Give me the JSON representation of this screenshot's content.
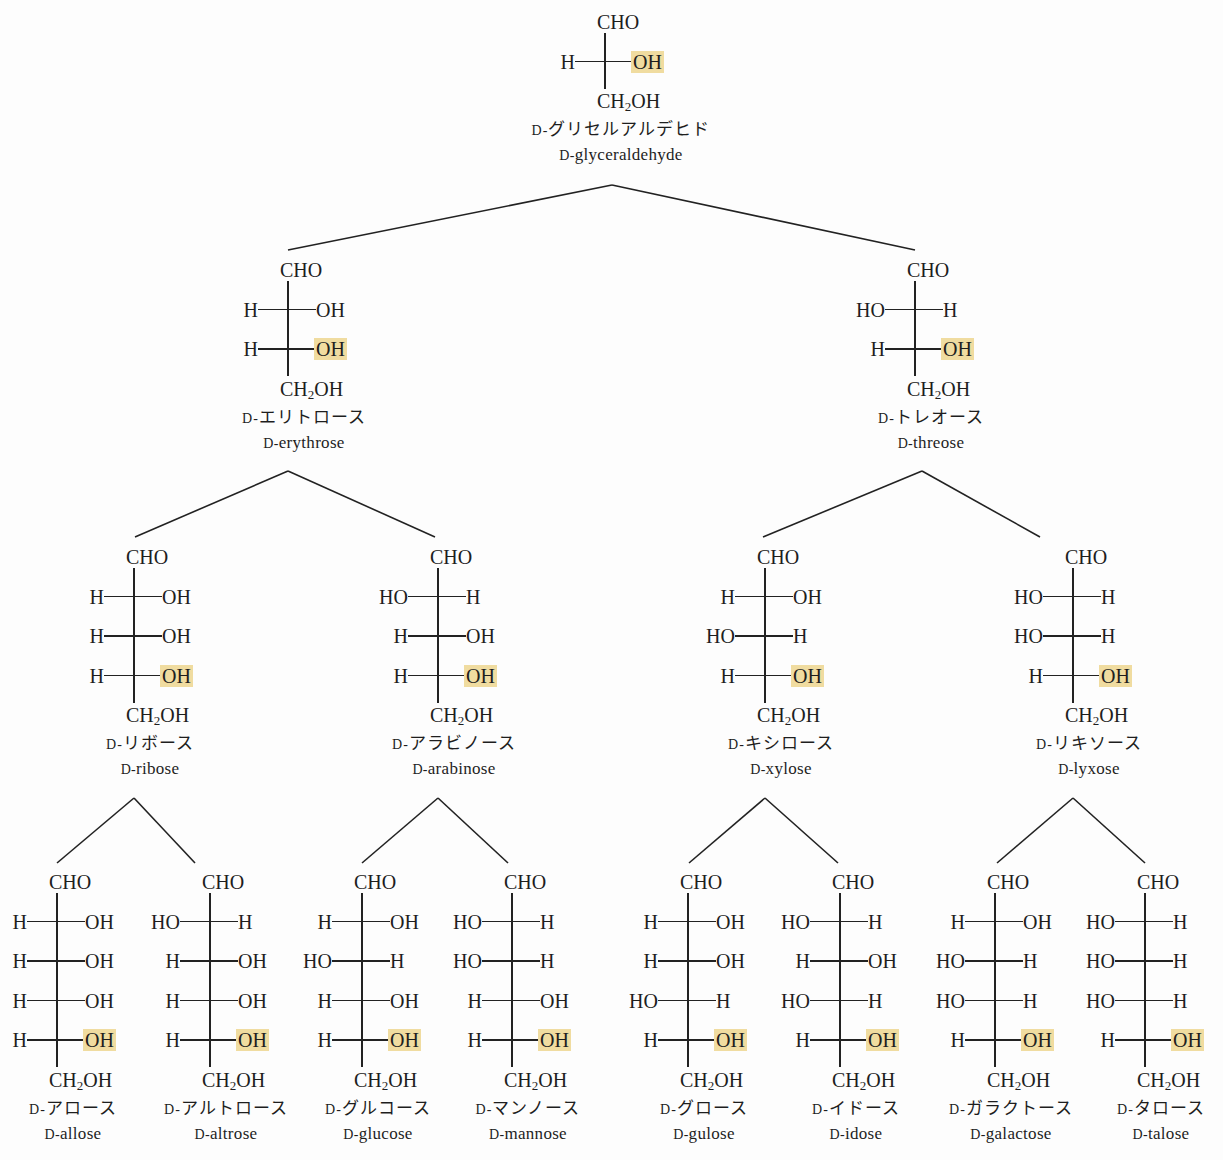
{
  "diagram": {
    "highlight_color": "#f0dca0",
    "line_color": "#222222",
    "top_group": "CHO",
    "bottom_group_parts": [
      "CH",
      "2",
      "OH"
    ],
    "prefix": "D-",
    "structures": [
      {
        "id": "glyceraldehyde",
        "level": 0,
        "name_jp": "グリセルアルデヒド",
        "name_en": "glyceraldehyde",
        "rows": [
          [
            "H",
            "OH"
          ]
        ]
      },
      {
        "id": "erythrose",
        "level": 1,
        "name_jp": "エリトロース",
        "name_en": "erythrose",
        "rows": [
          [
            "H",
            "OH"
          ],
          [
            "H",
            "OH"
          ]
        ]
      },
      {
        "id": "threose",
        "level": 1,
        "name_jp": "トレオース",
        "name_en": "threose",
        "rows": [
          [
            "HO",
            "H"
          ],
          [
            "H",
            "OH"
          ]
        ]
      },
      {
        "id": "ribose",
        "level": 2,
        "name_jp": "リボース",
        "name_en": "ribose",
        "rows": [
          [
            "H",
            "OH"
          ],
          [
            "H",
            "OH"
          ],
          [
            "H",
            "OH"
          ]
        ]
      },
      {
        "id": "arabinose",
        "level": 2,
        "name_jp": "アラビノース",
        "name_en": "arabinose",
        "rows": [
          [
            "HO",
            "H"
          ],
          [
            "H",
            "OH"
          ],
          [
            "H",
            "OH"
          ]
        ]
      },
      {
        "id": "xylose",
        "level": 2,
        "name_jp": "キシロース",
        "name_en": "xylose",
        "rows": [
          [
            "H",
            "OH"
          ],
          [
            "HO",
            "H"
          ],
          [
            "H",
            "OH"
          ]
        ]
      },
      {
        "id": "lyxose",
        "level": 2,
        "name_jp": "リキソース",
        "name_en": "lyxose",
        "rows": [
          [
            "HO",
            "H"
          ],
          [
            "HO",
            "H"
          ],
          [
            "H",
            "OH"
          ]
        ]
      },
      {
        "id": "allose",
        "level": 3,
        "name_jp": "アロース",
        "name_en": "allose",
        "rows": [
          [
            "H",
            "OH"
          ],
          [
            "H",
            "OH"
          ],
          [
            "H",
            "OH"
          ],
          [
            "H",
            "OH"
          ]
        ]
      },
      {
        "id": "altrose",
        "level": 3,
        "name_jp": "アルトロース",
        "name_en": "altrose",
        "rows": [
          [
            "HO",
            "H"
          ],
          [
            "H",
            "OH"
          ],
          [
            "H",
            "OH"
          ],
          [
            "H",
            "OH"
          ]
        ]
      },
      {
        "id": "glucose",
        "level": 3,
        "name_jp": "グルコース",
        "name_en": "glucose",
        "rows": [
          [
            "H",
            "OH"
          ],
          [
            "HO",
            "H"
          ],
          [
            "H",
            "OH"
          ],
          [
            "H",
            "OH"
          ]
        ]
      },
      {
        "id": "mannose",
        "level": 3,
        "name_jp": "マンノース",
        "name_en": "mannose",
        "rows": [
          [
            "HO",
            "H"
          ],
          [
            "HO",
            "H"
          ],
          [
            "H",
            "OH"
          ],
          [
            "H",
            "OH"
          ]
        ]
      },
      {
        "id": "gulose",
        "level": 3,
        "name_jp": "グロース",
        "name_en": "gulose",
        "rows": [
          [
            "H",
            "OH"
          ],
          [
            "H",
            "OH"
          ],
          [
            "HO",
            "H"
          ],
          [
            "H",
            "OH"
          ]
        ]
      },
      {
        "id": "idose",
        "level": 3,
        "name_jp": "イドース",
        "name_en": "idose",
        "rows": [
          [
            "HO",
            "H"
          ],
          [
            "H",
            "OH"
          ],
          [
            "HO",
            "H"
          ],
          [
            "H",
            "OH"
          ]
        ]
      },
      {
        "id": "galactose",
        "level": 3,
        "name_jp": "ガラクトース",
        "name_en": "galactose",
        "rows": [
          [
            "H",
            "OH"
          ],
          [
            "HO",
            "H"
          ],
          [
            "HO",
            "H"
          ],
          [
            "H",
            "OH"
          ]
        ]
      },
      {
        "id": "talose",
        "level": 3,
        "name_jp": "タロース",
        "name_en": "talose",
        "rows": [
          [
            "HO",
            "H"
          ],
          [
            "HO",
            "H"
          ],
          [
            "HO",
            "H"
          ],
          [
            "H",
            "OH"
          ]
        ]
      }
    ],
    "edges": [
      [
        "glyceraldehyde",
        "erythrose"
      ],
      [
        "glyceraldehyde",
        "threose"
      ],
      [
        "erythrose",
        "ribose"
      ],
      [
        "erythrose",
        "arabinose"
      ],
      [
        "threose",
        "xylose"
      ],
      [
        "threose",
        "lyxose"
      ],
      [
        "ribose",
        "allose"
      ],
      [
        "ribose",
        "altrose"
      ],
      [
        "arabinose",
        "glucose"
      ],
      [
        "arabinose",
        "mannose"
      ],
      [
        "xylose",
        "gulose"
      ],
      [
        "xylose",
        "idose"
      ],
      [
        "lyxose",
        "galactose"
      ],
      [
        "lyxose",
        "talose"
      ]
    ]
  }
}
